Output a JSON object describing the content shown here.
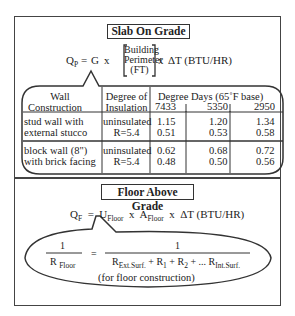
{
  "slab": {
    "title": "Slab On Grade",
    "formula": {
      "lhs": "Q",
      "lhs_sub": "P",
      "eq": "=",
      "G": "G",
      "times1": "x",
      "bracket_lines": [
        "Building",
        "Perimeter",
        "(FT)"
      ],
      "times2": "x",
      "rhs": "ΔT (BTU/HR)"
    },
    "table": {
      "headers": {
        "wall": [
          "Wall",
          "Construction"
        ],
        "insulation": [
          "Degree of",
          "Insulation"
        ],
        "degree_days": "Degree Days (65˚F base)",
        "dd_values": [
          "7433",
          "5350",
          "2950"
        ]
      },
      "rows": [
        {
          "wall": [
            "stud wall with",
            "external stucco"
          ],
          "insulation": [
            "uninsulated",
            "R=5.4"
          ],
          "values": [
            [
              "1.15",
              "0.51"
            ],
            [
              "1.20",
              "0.53"
            ],
            [
              "1.34",
              "0.58"
            ]
          ]
        },
        {
          "wall": [
            "block wall (8\")",
            "with brick facing"
          ],
          "insulation": [
            "uninsulated",
            "R=5.4"
          ],
          "values": [
            [
              "0.62",
              "0.48"
            ],
            [
              "0.68",
              "0.50"
            ],
            [
              "0.72",
              "0.56"
            ]
          ]
        }
      ]
    }
  },
  "floor": {
    "title": "Floor Above Grade",
    "formula": {
      "lhs": "Q",
      "lhs_sub": "F",
      "eq": "=",
      "U": "U",
      "U_sub": "Floor",
      "times1": "x",
      "A": "A",
      "A_sub": "Floor",
      "times2": "x",
      "rhs": "ΔT (BTU/HR)"
    },
    "r_equation": {
      "left_num": "1",
      "left_den": "R",
      "left_den_sub": "Floor",
      "eq": "=",
      "right_num": "1",
      "right_den_parts": {
        "r_ext": "R",
        "r_ext_sub": "Ext.Surf.",
        "plus1": "+ R",
        "r1_sub": "1",
        "plus2": "+ R",
        "r2_sub": "2",
        "dots": "+ ... R",
        "r_int_sub": "Int.Surf."
      },
      "note": "(for floor construction)"
    }
  }
}
